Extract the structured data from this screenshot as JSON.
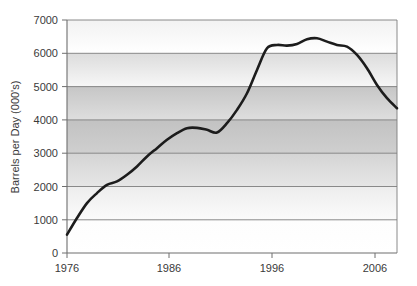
{
  "chart_data": {
    "type": "line",
    "title": "",
    "xlabel": "",
    "ylabel": "Barrels per Day (000's)",
    "xlim": [
      1976,
      2009
    ],
    "ylim": [
      0,
      7000
    ],
    "grid": true,
    "legend": "none",
    "x_ticks": [
      "1976",
      "1986",
      "1996",
      "2006"
    ],
    "x_tick_values": [
      1976,
      1986,
      1996,
      2006
    ],
    "y_ticks": [
      "0",
      "1000",
      "2000",
      "3000",
      "4000",
      "5000",
      "6000",
      "7000"
    ],
    "y_tick_values": [
      0,
      1000,
      2000,
      3000,
      4000,
      5000,
      6000,
      7000
    ],
    "series": [
      {
        "name": "Barrels per Day",
        "x": [
          1976,
          1977,
          1978,
          1979,
          1980,
          1981,
          1982,
          1983,
          1984,
          1985,
          1986,
          1987,
          1988,
          1989,
          1990,
          1991,
          1992,
          1993,
          1994,
          1995,
          1996,
          1997,
          1998,
          1999,
          2000,
          2001,
          2002,
          2003,
          2004,
          2005,
          2006,
          2007,
          2008,
          2009
        ],
        "values": [
          550,
          1050,
          1500,
          1800,
          2050,
          2150,
          2350,
          2600,
          2900,
          3150,
          3400,
          3600,
          3750,
          3760,
          3700,
          3620,
          3900,
          4300,
          4800,
          5500,
          6150,
          6250,
          6230,
          6280,
          6420,
          6450,
          6350,
          6250,
          6200,
          5950,
          5550,
          5050,
          4650,
          4350
        ]
      }
    ],
    "colors": {
      "line": "#1c1c1c",
      "gridline": "#7d7d7d",
      "axis": "#6e6e6e",
      "text": "#3a3a3a",
      "plot_band_light": "#fcfcfc",
      "plot_band_dark": "#c9c9c9"
    }
  }
}
